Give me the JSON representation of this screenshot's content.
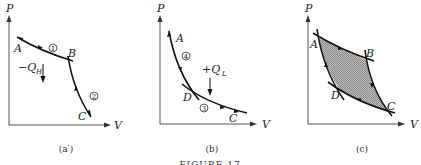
{
  "figure": {
    "caption": "FIGURE 17",
    "panels": [
      {
        "id": "a-prime",
        "caption": "(a′)",
        "axes": {
          "x_label": "V",
          "y_label": "P"
        },
        "points": [
          "A",
          "B",
          "C"
        ],
        "steps": [
          {
            "number": "1",
            "from": "A",
            "to": "B"
          },
          {
            "number": "2",
            "from": "B",
            "to": "C"
          }
        ],
        "heat": {
          "sign": "−",
          "symbol": "Q",
          "subscript": "H",
          "arrow": "down"
        }
      },
      {
        "id": "b",
        "caption": "(b)",
        "axes": {
          "x_label": "V",
          "y_label": "P"
        },
        "points": [
          "A",
          "D",
          "C"
        ],
        "steps": [
          {
            "number": "4",
            "from": "A",
            "to": "D"
          },
          {
            "number": "3",
            "from": "D",
            "to": "C"
          }
        ],
        "heat": {
          "sign": "+",
          "symbol": "Q",
          "subscript": "L",
          "arrow": "down"
        }
      },
      {
        "id": "c",
        "caption": "(c)",
        "axes": {
          "x_label": "V",
          "y_label": "P"
        },
        "points": [
          "A",
          "B",
          "C",
          "D"
        ],
        "shaded_region": "ABCD cycle"
      }
    ]
  }
}
